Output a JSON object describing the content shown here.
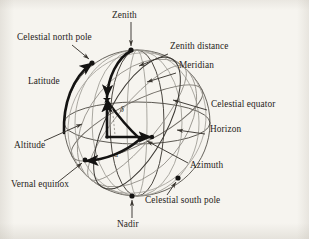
{
  "figure": {
    "type": "celestial-sphere-diagram",
    "background_color": "#f6f4ef",
    "ink_color": "#262320",
    "light_ink_color": "#8e8b84",
    "sphere": {
      "cx": 137,
      "cy": 123,
      "r": 73
    },
    "labels": {
      "zenith": "Zenith",
      "celestial_north_pole": "Celestial north pole",
      "zenith_distance": "Zenith distance",
      "meridian": "Meridian",
      "latitude": "Latitude",
      "celestial_equator": "Celestial equator",
      "horizon": "Horizon",
      "altitude": "Altitude",
      "azimuth": "Azimuth",
      "vernal_equinox": "Vernal equinox",
      "celestial_south_pole": "Celestial south pole",
      "nadir": "Nadir",
      "right_ascension_symbol": "α",
      "declination_symbol": "δ"
    },
    "points": {
      "zenith": {
        "x": 131,
        "y": 50
      },
      "nadir": {
        "x": 132,
        "y": 196
      },
      "celestial_north_pole": {
        "x": 92,
        "y": 63
      },
      "celestial_south_pole": {
        "x": 178,
        "y": 178
      },
      "star": {
        "x": 107,
        "y": 101
      },
      "vernal_equinox": {
        "x": 85,
        "y": 160
      },
      "observer": {
        "x": 107,
        "y": 137
      },
      "azimuth_end": {
        "x": 152,
        "y": 137
      }
    }
  }
}
